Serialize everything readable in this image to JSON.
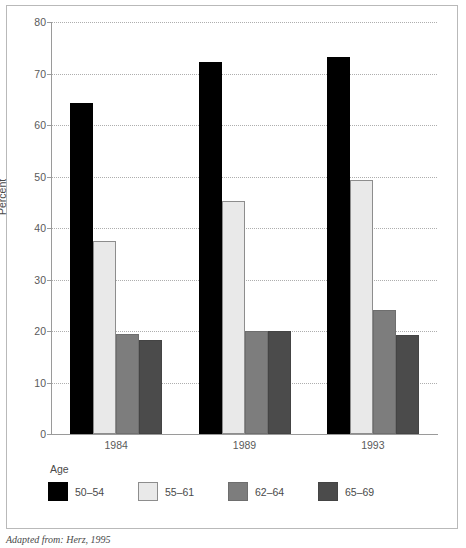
{
  "chart_data": {
    "type": "bar",
    "title": "",
    "xlabel": "",
    "ylabel": "Percent",
    "ylim": [
      0,
      80
    ],
    "yticks": [
      0,
      10,
      20,
      30,
      40,
      50,
      60,
      70,
      80
    ],
    "grid": true,
    "legend_position": "bottom-left",
    "legend_title": "Age",
    "categories": [
      "1984",
      "1989",
      "1993"
    ],
    "series": [
      {
        "name": "50–54",
        "color": "#000000",
        "values": [
          64.3,
          72.2,
          73.2
        ]
      },
      {
        "name": "55–61",
        "color": "#e9e9e9",
        "values": [
          37.4,
          45.2,
          49.3
        ]
      },
      {
        "name": "62–64",
        "color": "#7d7d7d",
        "values": [
          19.4,
          20.1,
          24.1
        ]
      },
      {
        "name": "65–69",
        "color": "#4b4b4b",
        "values": [
          18.3,
          20.1,
          19.2
        ]
      }
    ],
    "source_note": "Adapted from: Herz, 1995"
  }
}
